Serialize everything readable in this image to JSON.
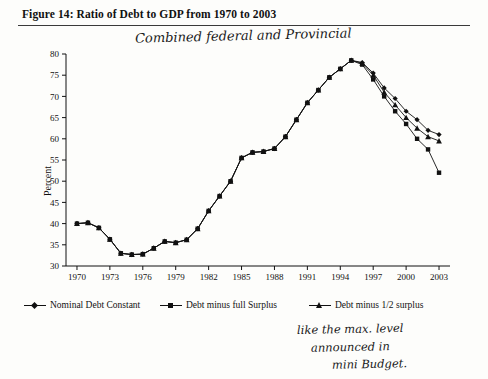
{
  "figure": {
    "caption": "Figure 14:  Ratio of Debt to GDP from 1970 to 2003"
  },
  "annotations": {
    "top": "Combined federal and Provincial",
    "bottom_line1": "like the max. level",
    "bottom_line2": "announced in",
    "bottom_line3": "mini Budget."
  },
  "legend": {
    "items": [
      {
        "label": "Nominal Debt  Constant",
        "marker": "diamond"
      },
      {
        "label": "Debt minus full Surplus",
        "marker": "square"
      },
      {
        "label": "Debt minus 1/2 surplus",
        "marker": "triangle"
      }
    ]
  },
  "chart_data": {
    "type": "line",
    "title": "Figure 14:  Ratio of Debt to GDP from 1970 to 2003",
    "xlabel": "",
    "ylabel": "Percent",
    "xlim": [
      1969,
      2004
    ],
    "ylim": [
      30,
      80
    ],
    "yticks": [
      30,
      35,
      40,
      45,
      50,
      55,
      60,
      65,
      70,
      75,
      80
    ],
    "xticks": [
      1970,
      1973,
      1976,
      1979,
      1982,
      1985,
      1988,
      1991,
      1994,
      1997,
      2000,
      2003
    ],
    "grid": false,
    "legend_position": "below",
    "x": [
      1970,
      1971,
      1972,
      1973,
      1974,
      1975,
      1976,
      1977,
      1978,
      1979,
      1980,
      1981,
      1982,
      1983,
      1984,
      1985,
      1986,
      1987,
      1988,
      1989,
      1990,
      1991,
      1992,
      1993,
      1994,
      1995,
      1996,
      1997,
      1998,
      1999,
      2000,
      2001,
      2002,
      2003
    ],
    "series": [
      {
        "name": "Nominal Debt  Constant",
        "marker": "diamond",
        "values": [
          40.0,
          40.2,
          39.0,
          36.3,
          33.0,
          32.7,
          32.8,
          34.2,
          35.8,
          35.5,
          36.2,
          38.8,
          43.0,
          46.5,
          50.0,
          55.5,
          56.8,
          57.0,
          57.7,
          60.5,
          64.5,
          68.5,
          71.5,
          74.5,
          76.5,
          78.5,
          78.0,
          75.5,
          72.0,
          69.5,
          66.5,
          64.5,
          62.0,
          61.0
        ]
      },
      {
        "name": "Debt minus full Surplus",
        "marker": "square",
        "values": [
          40.0,
          40.2,
          39.0,
          36.3,
          33.0,
          32.7,
          32.8,
          34.2,
          35.8,
          35.5,
          36.2,
          38.8,
          43.0,
          46.5,
          50.0,
          55.5,
          56.8,
          57.0,
          57.7,
          60.5,
          64.5,
          68.5,
          71.5,
          74.5,
          76.5,
          78.5,
          77.5,
          74.0,
          70.0,
          66.5,
          63.5,
          60.0,
          57.5,
          52.0
        ]
      },
      {
        "name": "Debt minus 1/2 surplus",
        "marker": "triangle",
        "values": [
          40.0,
          40.2,
          39.0,
          36.3,
          33.0,
          32.7,
          32.8,
          34.2,
          35.8,
          35.5,
          36.2,
          38.8,
          43.0,
          46.5,
          50.0,
          55.5,
          56.8,
          57.0,
          57.7,
          60.5,
          64.5,
          68.5,
          71.5,
          74.5,
          76.5,
          78.5,
          77.8,
          75.0,
          71.0,
          68.0,
          65.0,
          62.5,
          60.5,
          59.5
        ]
      }
    ]
  }
}
